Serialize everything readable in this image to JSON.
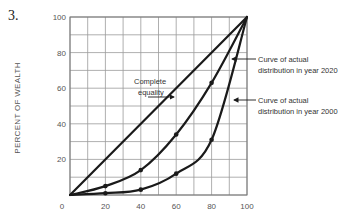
{
  "question_number": "3.",
  "chart_data": {
    "type": "line",
    "title": "",
    "xlabel": "",
    "ylabel": "PERCENT OF WEALTH",
    "xlim": [
      0,
      100
    ],
    "ylim": [
      0,
      100
    ],
    "grid": true,
    "x_ticks": [
      "0",
      "20",
      "40",
      "60",
      "80",
      "100"
    ],
    "y_ticks": [
      "20",
      "40",
      "60",
      "80",
      "100"
    ],
    "series": [
      {
        "name": "Complete equality",
        "x": [
          0,
          100
        ],
        "y": [
          0,
          100
        ]
      },
      {
        "name": "Curve of actual distribution in year 2020",
        "x": [
          0,
          20,
          40,
          60,
          80,
          100
        ],
        "y": [
          0,
          5,
          14,
          34,
          63,
          100
        ]
      },
      {
        "name": "Curve of actual distribution in year 2000",
        "x": [
          0,
          20,
          40,
          60,
          80,
          100
        ],
        "y": [
          0,
          1,
          3,
          12,
          31,
          100
        ]
      }
    ],
    "annotations": [
      {
        "text_lines": [
          "Complete",
          "equality"
        ],
        "points_to": "Complete equality"
      },
      {
        "text_lines": [
          "Curve of actual",
          "distribution in year 2020"
        ],
        "points_to": "Curve of actual distribution in year 2020"
      },
      {
        "text_lines": [
          "Curve of actual",
          "distribution in year 2000"
        ],
        "points_to": "Curve of actual distribution in year 2000"
      }
    ]
  }
}
